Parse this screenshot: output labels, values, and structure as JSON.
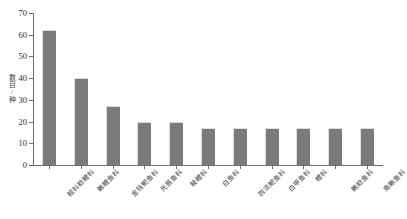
{
  "chart_data": {
    "type": "bar",
    "title": "",
    "subtitle": "",
    "xlabel": "",
    "ylabel": "数目/种",
    "ylim": [
      0,
      70
    ],
    "yticks": [
      0,
      10,
      20,
      30,
      40,
      50,
      60,
      70
    ],
    "grid": false,
    "legend": null,
    "categories": [
      "鲿科鲶鲤科",
      "鳅鲤鱼科",
      "金钱鲃鱼科",
      "光唇鱼科",
      "鲮鲤科",
      "白鱼科",
      "四须鲃鱼科",
      "白甲鱼科",
      "鲤科",
      "鳅鲶鱼科",
      "南鳅鱼科"
    ],
    "values": [
      62,
      40,
      27,
      20,
      20,
      17,
      17,
      17,
      17,
      17,
      17
    ],
    "bar_color": "#7a7a7a",
    "axis_color": "#6d6d6d",
    "background": "#ffffff"
  }
}
